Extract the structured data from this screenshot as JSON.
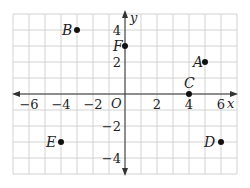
{
  "diagram": {
    "type": "coordinate-plane",
    "axes": {
      "x_label": "x",
      "y_label": "y",
      "origin_label": "O",
      "x_ticks": [
        {
          "value": -6,
          "label": "−6"
        },
        {
          "value": -4,
          "label": "−4"
        },
        {
          "value": -2,
          "label": "−2"
        },
        {
          "value": 2,
          "label": "2"
        },
        {
          "value": 4,
          "label": "4"
        },
        {
          "value": 6,
          "label": "6"
        }
      ],
      "y_ticks": [
        {
          "value": 4,
          "label": "4"
        },
        {
          "value": 2,
          "label": "2"
        },
        {
          "value": -2,
          "label": "−2"
        },
        {
          "value": -4,
          "label": "−4"
        }
      ],
      "x_range": [
        -7,
        7
      ],
      "y_range": [
        -5,
        5
      ],
      "grid": true
    },
    "points": [
      {
        "name": "A",
        "x": 5,
        "y": 2
      },
      {
        "name": "B",
        "x": -3,
        "y": 4
      },
      {
        "name": "C",
        "x": 4,
        "y": 0
      },
      {
        "name": "D",
        "x": 6,
        "y": -3
      },
      {
        "name": "E",
        "x": -4,
        "y": -3
      },
      {
        "name": "F",
        "x": 0,
        "y": 3
      }
    ],
    "colors": {
      "grid": "#c8c8c8",
      "axis": "#333333",
      "point": "#111111",
      "text": "#222222"
    }
  }
}
